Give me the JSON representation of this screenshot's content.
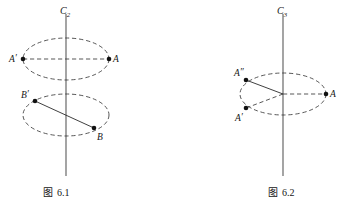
{
  "document": {
    "kind": "geometry-diagram-pair",
    "background_color": "#ffffff",
    "ink_color": "#1a1a1a"
  },
  "figures": [
    {
      "id": "fig-6-1",
      "caption_prefix": "图",
      "caption_number": "6.1",
      "caption_full": "图 6.1",
      "axis": {
        "name": "C",
        "subscript": "2",
        "label_full": "C2",
        "orientation": "vertical",
        "color": "#5a5a5a"
      },
      "orbits": [
        {
          "name": "upper-orbit",
          "center_x": 66,
          "center_y": 59,
          "radius_x": 43,
          "radius_y": 21,
          "style": "dashed"
        },
        {
          "name": "lower-orbit",
          "center_x": 66,
          "center_y": 115,
          "radius_x": 43,
          "radius_y": 21,
          "style": "dashed"
        }
      ],
      "points": [
        {
          "label": "A",
          "primes": 1,
          "label_full": "A'",
          "x": 23,
          "y": 59,
          "label_side": "left",
          "orbit": "upper-orbit"
        },
        {
          "label": "A",
          "primes": 0,
          "label_full": "A",
          "x": 109,
          "y": 59,
          "label_side": "right",
          "orbit": "upper-orbit"
        },
        {
          "label": "B",
          "primes": 1,
          "label_full": "B'",
          "x": 35,
          "y": 101,
          "label_side": "left",
          "orbit": "lower-orbit"
        },
        {
          "label": "B",
          "primes": 0,
          "label_full": "B",
          "x": 94,
          "y": 128,
          "label_side": "right",
          "orbit": "lower-orbit"
        }
      ],
      "connectors": [
        {
          "name": "chord-A-Aprime",
          "from": "A'",
          "to": "A",
          "style": "dashed"
        },
        {
          "name": "chord-B-Bprime",
          "from": "B'",
          "to": "B",
          "style": "solid"
        }
      ]
    },
    {
      "id": "fig-6-2",
      "caption_prefix": "图",
      "caption_number": "6.2",
      "caption_full": "图 6.2",
      "axis": {
        "name": "C",
        "subscript": "3",
        "label_full": "C3",
        "orientation": "vertical",
        "color": "#5a5a5a"
      },
      "orbits": [
        {
          "name": "single-orbit",
          "center_x": 283,
          "center_y": 94,
          "radius_x": 43,
          "radius_y": 21,
          "style": "dashed"
        }
      ],
      "points": [
        {
          "label": "A",
          "primes": 0,
          "label_full": "A",
          "x": 326,
          "y": 94,
          "label_side": "right",
          "orbit": "single-orbit"
        },
        {
          "label": "A",
          "primes": 2,
          "label_full": "A″",
          "x": 246,
          "y": 80,
          "label_side": "above-left",
          "orbit": "single-orbit"
        },
        {
          "label": "A",
          "primes": 1,
          "label_full": "A′",
          "x": 246,
          "y": 108,
          "label_side": "below-left",
          "orbit": "single-orbit"
        }
      ],
      "connectors": [
        {
          "name": "radius-center-A",
          "from": "center",
          "to": "A",
          "style": "dashed"
        },
        {
          "name": "radius-center-Aprime",
          "from": "center",
          "to": "A'",
          "style": "dashed"
        },
        {
          "name": "radius-center-Adoubleprime",
          "from": "center",
          "to": "A″",
          "style": "solid"
        }
      ]
    }
  ],
  "labels": {
    "fig1_axis_letter": "C",
    "fig1_axis_sub": "2",
    "fig1_A_prime": "A",
    "fig1_A_prime_mark": "′",
    "fig1_A": "A",
    "fig1_B_prime": "B",
    "fig1_B_prime_mark": "′",
    "fig1_B": "B",
    "fig1_caption_cjk": "图",
    "fig1_caption_num": "6.1",
    "fig2_axis_letter": "C",
    "fig2_axis_sub": "3",
    "fig2_A": "A",
    "fig2_A_prime": "A",
    "fig2_A_prime_mark": "′",
    "fig2_A_dprime": "A",
    "fig2_A_dprime_mark": "″",
    "fig2_caption_cjk": "图",
    "fig2_caption_num": "6.2"
  }
}
